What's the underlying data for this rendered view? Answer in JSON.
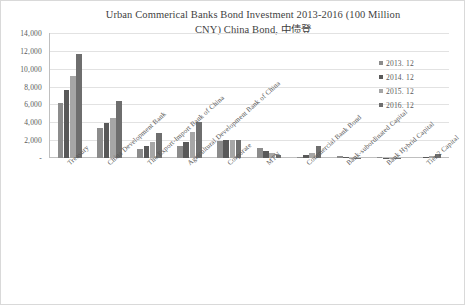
{
  "chart_data": {
    "type": "bar",
    "title": "Urban Commerical Banks Bond Investment 2013-2016 (100 Million\nCNY) China Bond, 中债登",
    "xlabel": "",
    "ylabel": "",
    "ylim": [
      0,
      14000
    ],
    "ytick_labels": [
      "14,000",
      "12,000",
      "10,000",
      "8,000",
      "6,000",
      "4,000",
      "2,000",
      "-"
    ],
    "ytick_values": [
      14000,
      12000,
      10000,
      8000,
      6000,
      4000,
      2000,
      0
    ],
    "grid": true,
    "legend_position": "upper-right",
    "categories": [
      "Treasury",
      "China Development Bank",
      "The Export-Import Bank of China",
      "Agricultural Development Bank of China",
      "Corporate",
      "MTN",
      "Commercial Bank Bond",
      "Bank-subordinated Capital",
      "Bank Hybrid Capital",
      "Tier 2 Capital"
    ],
    "series": [
      {
        "name": "2013. 12",
        "color": "#8c8c8c",
        "values": [
          6200,
          3400,
          1000,
          1400,
          1950,
          1150,
          150,
          180,
          60,
          0
        ]
      },
      {
        "name": "2014. 12",
        "color": "#595959",
        "values": [
          7600,
          3900,
          1300,
          1750,
          2000,
          800,
          350,
          60,
          30,
          60
        ]
      },
      {
        "name": "2015. 12",
        "color": "#a6a6a6",
        "values": [
          9200,
          4500,
          1750,
          2900,
          2000,
          550,
          600,
          40,
          20,
          200
        ]
      },
      {
        "name": "2016. 12",
        "color": "#6e6e6e",
        "values": [
          11600,
          6400,
          2800,
          4000,
          2000,
          300,
          1350,
          30,
          10,
          400
        ]
      }
    ]
  },
  "legend": {
    "items": [
      {
        "label": "2013. 12"
      },
      {
        "label": "2014. 12"
      },
      {
        "label": "2015. 12"
      },
      {
        "label": "2016. 12"
      }
    ]
  }
}
